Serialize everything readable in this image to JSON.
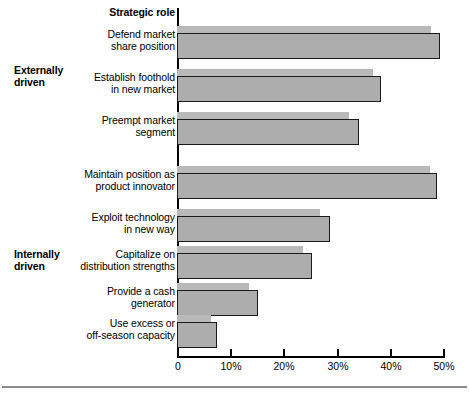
{
  "chart_data": {
    "type": "bar",
    "title": "Strategic role",
    "xlabel": "",
    "ylabel": "",
    "orientation": "horizontal",
    "xlim": [
      0,
      53
    ],
    "grid": false,
    "legend_position": "none",
    "tick_labels": [
      "0",
      "10%",
      "20%",
      "30%",
      "40%",
      "50%"
    ],
    "tick_values": [
      0,
      10,
      20,
      30,
      40,
      50
    ],
    "group_labels": [
      {
        "text": "Externally\ndriven",
        "categories": [
          0,
          1,
          2
        ]
      },
      {
        "text": "Internally\ndriven",
        "categories": [
          3,
          4,
          5,
          6,
          7
        ]
      }
    ],
    "categories": [
      "Defend market\nshare position",
      "Establish foothold\nin new market",
      "Preempt market\nsegment",
      "Maintain position as\nproduct innovator",
      "Exploit technology\nin new way",
      "Capitalize on\ndistribution strengths",
      "Provide a cash\ngenerator",
      "Use excess or\noff-season capacity"
    ],
    "series": [
      {
        "name": "back-series",
        "color": "#b9b9b9",
        "values": [
          47.7,
          36.8,
          32.4,
          47.6,
          26.8,
          23.7,
          13.6,
          6.4
        ]
      },
      {
        "name": "front-series",
        "color": "#adadad",
        "values": [
          49.5,
          38.3,
          34.3,
          48.8,
          28.8,
          25.3,
          15.2,
          7.6
        ]
      }
    ]
  },
  "axis": {
    "title": "Strategic role"
  }
}
